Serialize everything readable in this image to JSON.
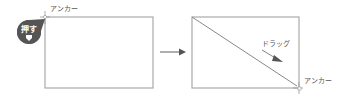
{
  "diagram": {
    "left_panel": {
      "anchor_label": "アンカー",
      "press_badge": {
        "label": "押す",
        "icon": "pointer-down-icon"
      }
    },
    "transition_arrow": {
      "icon": "arrow-right-icon"
    },
    "right_panel": {
      "drag_label": "ドラッグ",
      "anchor_label": "アンカー"
    }
  },
  "colors": {
    "frame": "#aaaaaa",
    "badge": "#555555",
    "arrow": "#777777",
    "text": "#555555"
  }
}
